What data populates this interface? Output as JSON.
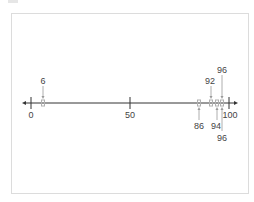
{
  "number_line": {
    "min": 0,
    "max": 100,
    "ticks": [
      {
        "value": 0,
        "label": "0"
      },
      {
        "value": 50,
        "label": "50"
      },
      {
        "value": 100,
        "label": "100"
      }
    ],
    "points": [
      {
        "value": 6,
        "label": "6",
        "position": "above"
      },
      {
        "value": 86,
        "label": "86",
        "position": "below"
      },
      {
        "value": 92,
        "label": "92",
        "position": "above"
      },
      {
        "value": 94,
        "label": "94",
        "position": "below"
      },
      {
        "value": 96,
        "label": "96",
        "position": "above"
      },
      {
        "value": 96,
        "label": "96",
        "position": "below"
      }
    ],
    "colors": {
      "axis": "#333333",
      "point": "#b0b0b0",
      "arrow": "#9a9a9a",
      "label": "#444444",
      "frame": "#dcdcdc"
    }
  }
}
